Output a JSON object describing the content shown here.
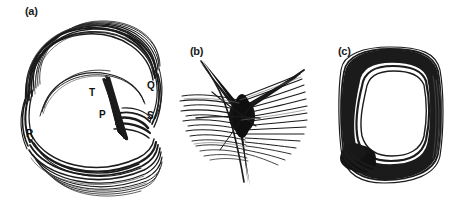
{
  "figure": {
    "background_color": "#ffffff",
    "ink_color": "#1b1b1b",
    "width": 465,
    "height": 210,
    "panels": [
      {
        "id": "a",
        "label": "(a)",
        "label_x": 25,
        "label_y": 6,
        "drawing_kind": "multi-loop-ellipse-scribble",
        "annotations": [
          {
            "text": "T",
            "x": 89,
            "y": 88
          },
          {
            "text": "Q",
            "x": 147,
            "y": 81
          },
          {
            "text": "P",
            "x": 99,
            "y": 110
          },
          {
            "text": "S",
            "x": 147,
            "y": 111
          },
          {
            "text": "R",
            "x": 26,
            "y": 129
          }
        ]
      },
      {
        "id": "b",
        "label": "(b)",
        "label_x": 190,
        "label_y": 46,
        "drawing_kind": "star-burst-scribble",
        "annotations": []
      },
      {
        "id": "c",
        "label": "(c)",
        "label_x": 338,
        "label_y": 46,
        "drawing_kind": "thick-rounded-loop-scribble",
        "annotations": []
      }
    ]
  }
}
